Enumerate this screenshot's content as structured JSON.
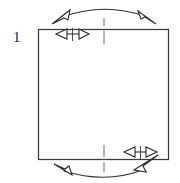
{
  "figure": {
    "label": "1",
    "background_color": "#ffffff",
    "line_color": "#3a3a3a",
    "centerline_color": "#6a6a6a",
    "arrow_color": "#2e2e2e",
    "shape": {
      "name": "square",
      "left": 38,
      "top": 29,
      "right": 168,
      "bottom": 159,
      "width": 130,
      "height": 130
    },
    "centerline": {
      "x": 104,
      "style": "dash-dot",
      "top_segment": "above square top edge",
      "bottom_segment": "below square bottom edge"
    },
    "annotations": [
      {
        "name": "top-arc-arrow",
        "type": "curved-double-headed-arrow",
        "position": "above top edge",
        "direction": "bidirectional",
        "span_from_x": 56,
        "span_to_x": 148,
        "apex_y": 9
      },
      {
        "name": "top-left-small-arrow",
        "type": "straight-double-headed-arrow",
        "position": "just below top edge, left of centerline",
        "direction": "horizontal bidirectional",
        "from_x": 57,
        "to_x": 88,
        "y": 33
      },
      {
        "name": "bottom-arc-arrow",
        "type": "curved-double-headed-arrow",
        "position": "below bottom edge",
        "direction": "bidirectional",
        "span_from_x": 57,
        "span_to_x": 150,
        "apex_y": 177
      },
      {
        "name": "bottom-right-small-arrow",
        "type": "straight-double-headed-arrow",
        "position": "just above bottom edge, right of centerline",
        "direction": "horizontal bidirectional",
        "from_x": 124,
        "to_x": 156,
        "y": 153
      }
    ]
  }
}
